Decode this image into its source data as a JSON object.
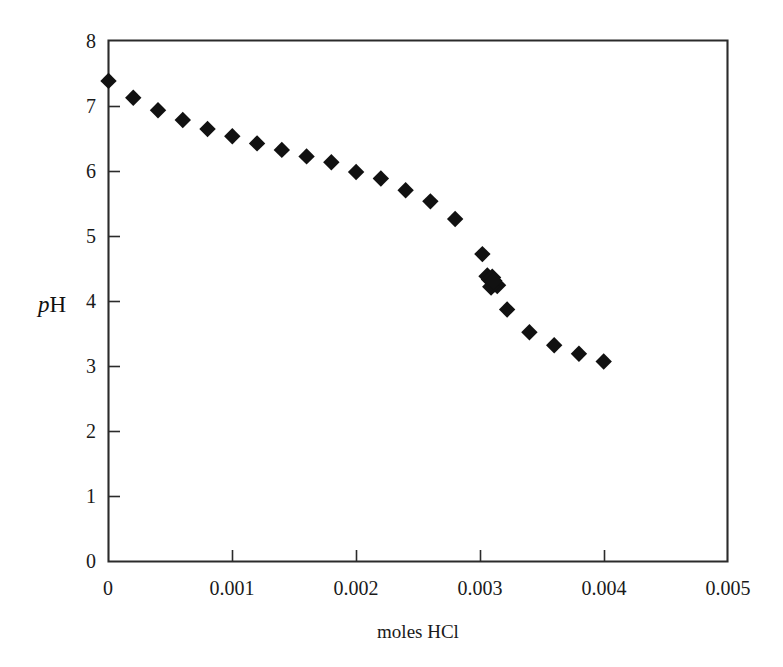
{
  "chart_data": {
    "type": "scatter",
    "title": "",
    "xlabel": "moles HCl",
    "ylabel": "pH",
    "ylabel_parts": {
      "italic": "p",
      "upright": "H"
    },
    "xlim": [
      0,
      0.005
    ],
    "ylim": [
      0,
      8
    ],
    "xticks": [
      0,
      0.001,
      0.002,
      0.003,
      0.004,
      0.005
    ],
    "xtick_labels": [
      "0",
      "0.001",
      "0.002",
      "0.003",
      "0.004",
      "0.005"
    ],
    "yticks": [
      0,
      1,
      2,
      3,
      4,
      5,
      6,
      7,
      8
    ],
    "ytick_labels": [
      "0",
      "1",
      "2",
      "3",
      "4",
      "5",
      "6",
      "7",
      "8"
    ],
    "grid": false,
    "legend": false,
    "marker": "diamond",
    "marker_color": "#111111",
    "series": [
      {
        "name": "titration curve",
        "x": [
          0.0,
          0.0002,
          0.0004,
          0.0006,
          0.0008,
          0.001,
          0.0012,
          0.0014,
          0.0016,
          0.0018,
          0.002,
          0.0022,
          0.0024,
          0.0026,
          0.0028,
          0.00302,
          0.0031,
          0.00322,
          0.0034,
          0.0036,
          0.0038,
          0.004
        ],
        "y": [
          7.38,
          7.12,
          6.93,
          6.78,
          6.64,
          6.53,
          6.42,
          6.32,
          6.22,
          6.13,
          5.98,
          5.88,
          5.7,
          5.53,
          5.26,
          4.72,
          4.3,
          3.87,
          3.52,
          3.32,
          3.19,
          3.07
        ]
      },
      {
        "name": "equivalence cluster",
        "note": "overlapping points forming a dense blob",
        "x": [
          0.00306,
          0.00308,
          0.0031,
          0.00312,
          0.00314,
          0.0031,
          0.00309,
          0.00311
        ],
        "y": [
          4.38,
          4.33,
          4.3,
          4.27,
          4.24,
          4.36,
          4.22,
          4.31
        ]
      }
    ]
  },
  "figure": {
    "background_color": "#ffffff",
    "axis_color": "#2b2b2b"
  }
}
